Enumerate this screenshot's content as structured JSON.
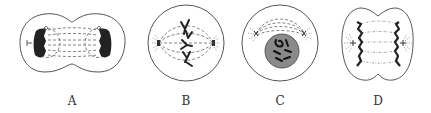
{
  "figure": {
    "cells": [
      {
        "label": "A",
        "stage": "telophase (cytokinesis beginning)",
        "center_x": 72
      },
      {
        "label": "B",
        "stage": "metaphase",
        "center_x": 186
      },
      {
        "label": "C",
        "stage": "prophase",
        "center_x": 280
      },
      {
        "label": "D",
        "stage": "anaphase",
        "center_x": 378
      }
    ],
    "colors": {
      "outline": "#555555",
      "chromosome": "#222222",
      "nucleus": "#8a8a8a",
      "background": "#ffffff"
    }
  }
}
